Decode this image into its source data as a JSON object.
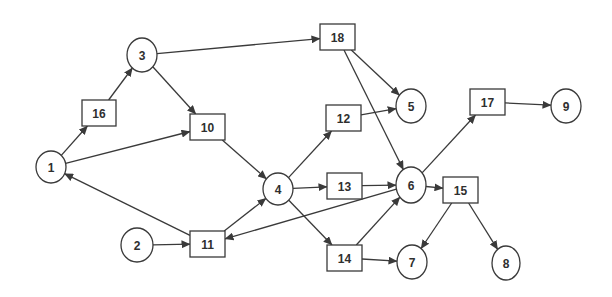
{
  "diagram": {
    "type": "directed-network",
    "colors": {
      "stroke": "#3a3a3a",
      "fill": "#ffffff",
      "text": "#2f2f2f",
      "background": "#ffffff"
    },
    "nodes": [
      {
        "id": "1",
        "label": "1",
        "shape": "circle",
        "x": 51,
        "y": 167,
        "rx": 15,
        "ry": 16
      },
      {
        "id": "2",
        "label": "2",
        "shape": "circle",
        "x": 137,
        "y": 245,
        "rx": 16,
        "ry": 17
      },
      {
        "id": "3",
        "label": "3",
        "shape": "circle",
        "x": 142,
        "y": 55,
        "rx": 15,
        "ry": 17
      },
      {
        "id": "4",
        "label": "4",
        "shape": "circle",
        "x": 278,
        "y": 189,
        "rx": 15,
        "ry": 16
      },
      {
        "id": "5",
        "label": "5",
        "shape": "circle",
        "x": 411,
        "y": 106,
        "rx": 15,
        "ry": 17
      },
      {
        "id": "6",
        "label": "6",
        "shape": "circle",
        "x": 411,
        "y": 185,
        "rx": 15,
        "ry": 18
      },
      {
        "id": "7",
        "label": "7",
        "shape": "circle",
        "x": 412,
        "y": 262,
        "rx": 15,
        "ry": 17
      },
      {
        "id": "8",
        "label": "8",
        "shape": "circle",
        "x": 506,
        "y": 263,
        "rx": 14,
        "ry": 17
      },
      {
        "id": "9",
        "label": "9",
        "shape": "circle",
        "x": 566,
        "y": 106,
        "rx": 15,
        "ry": 17
      },
      {
        "id": "10",
        "label": "10",
        "shape": "box",
        "x": 190,
        "y": 114,
        "w": 35,
        "h": 26
      },
      {
        "id": "11",
        "label": "11",
        "shape": "box",
        "x": 190,
        "y": 231,
        "w": 35,
        "h": 26
      },
      {
        "id": "12",
        "label": "12",
        "shape": "box",
        "x": 326,
        "y": 105,
        "w": 35,
        "h": 26
      },
      {
        "id": "13",
        "label": "13",
        "shape": "box",
        "x": 327,
        "y": 173,
        "w": 35,
        "h": 26
      },
      {
        "id": "14",
        "label": "14",
        "shape": "box",
        "x": 327,
        "y": 245,
        "w": 35,
        "h": 26
      },
      {
        "id": "15",
        "label": "15",
        "shape": "box",
        "x": 443,
        "y": 177,
        "w": 35,
        "h": 26
      },
      {
        "id": "16",
        "label": "16",
        "shape": "box",
        "x": 82,
        "y": 100,
        "w": 34,
        "h": 26
      },
      {
        "id": "17",
        "label": "17",
        "shape": "box",
        "x": 470,
        "y": 89,
        "w": 35,
        "h": 26
      },
      {
        "id": "18",
        "label": "18",
        "shape": "box",
        "x": 320,
        "y": 24,
        "w": 35,
        "h": 26
      }
    ],
    "edges": [
      {
        "from": "1",
        "to": "16"
      },
      {
        "from": "16",
        "to": "3"
      },
      {
        "from": "3",
        "to": "10"
      },
      {
        "from": "3",
        "to": "18"
      },
      {
        "from": "1",
        "to": "10"
      },
      {
        "from": "10",
        "to": "4"
      },
      {
        "from": "11",
        "to": "4"
      },
      {
        "from": "11",
        "to": "1"
      },
      {
        "from": "2",
        "to": "11"
      },
      {
        "from": "6",
        "to": "11"
      },
      {
        "from": "4",
        "to": "12"
      },
      {
        "from": "4",
        "to": "13"
      },
      {
        "from": "4",
        "to": "14"
      },
      {
        "from": "18",
        "to": "5"
      },
      {
        "from": "18",
        "to": "6"
      },
      {
        "from": "12",
        "to": "5"
      },
      {
        "from": "13",
        "to": "6"
      },
      {
        "from": "14",
        "to": "6"
      },
      {
        "from": "14",
        "to": "7"
      },
      {
        "from": "6",
        "to": "17"
      },
      {
        "from": "6",
        "to": "15"
      },
      {
        "from": "17",
        "to": "9"
      },
      {
        "from": "15",
        "to": "7"
      },
      {
        "from": "15",
        "to": "8"
      }
    ]
  }
}
